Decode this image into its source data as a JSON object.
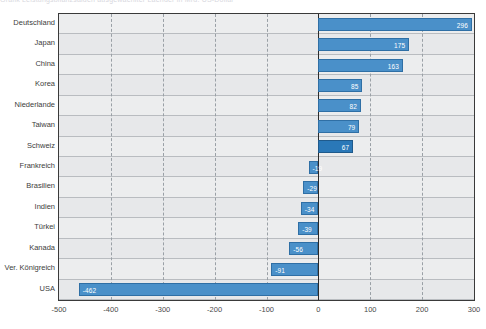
{
  "faint_header": "Grafik  Leistungsbilanzsalden ausgewaehlter Laender in Mrd. US-Dollar",
  "chart_data": {
    "type": "bar",
    "orientation": "horizontal",
    "title": "",
    "xlabel": "",
    "ylabel": "",
    "xlim": [
      -500,
      300
    ],
    "grid": true,
    "legend": "none",
    "xticks": [
      "-500",
      "-400",
      "-300",
      "-200",
      "-100",
      "0",
      "100",
      "200",
      "300"
    ],
    "xtick_values": [
      -500,
      -400,
      -300,
      -200,
      -100,
      0,
      100,
      200,
      300
    ],
    "categories": [
      "Deutschland",
      "Japan",
      "China",
      "Korea",
      "Niederlande",
      "Taiwan",
      "Schweiz",
      "Frankreich",
      "Brasilien",
      "Indien",
      "Türkei",
      "Kanada",
      "Ver. Königreich",
      "USA"
    ],
    "values": [
      296,
      175,
      163,
      85,
      82,
      79,
      67,
      -19,
      -29,
      -34,
      -39,
      -56,
      -91,
      -462
    ],
    "labels": [
      "296",
      "175",
      "163",
      "85",
      "82",
      "79",
      "67",
      "-19",
      "-29",
      "-34",
      "-39",
      "-56",
      "-91",
      "-462"
    ],
    "colors": {
      "bar_fill": "#4a90c9",
      "bar_fill_dark": "#2a78b8",
      "bar_border": "#2f6fa5",
      "plot_bg": "#ecedee",
      "grid": "#9aa0a6",
      "axis": "#2b2b2b",
      "label_text": "#3c3c3c",
      "value_text": "#ffffff"
    },
    "highlight_index": 6
  }
}
